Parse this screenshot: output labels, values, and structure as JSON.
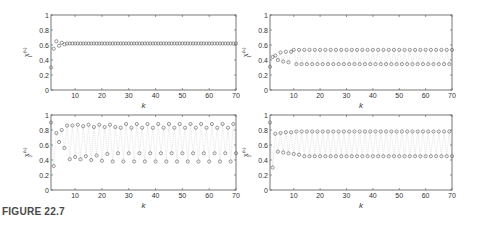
{
  "caption": "FIGURE 22.7",
  "chart_data": [
    {
      "type": "scatter",
      "panel": "top-left",
      "xlabel": "k",
      "ylabel": "x1^(k)",
      "ylabel_base": "x",
      "ylabel_sub": "1",
      "ylabel_sup": "(k)",
      "xlim": [
        1,
        70
      ],
      "ylim": [
        0,
        1
      ],
      "xticks": [
        10,
        20,
        30,
        40,
        50,
        60,
        70
      ],
      "yticks": [
        0,
        0.2,
        0.4,
        0.6,
        0.8,
        1
      ],
      "ytick_labels": [
        "0",
        "0.2",
        "0.4",
        "0.6",
        "0.8",
        "1"
      ],
      "grid": false,
      "marker": "circle",
      "series": [
        {
          "name": "x1",
          "initial": [
            0.3,
            0.55,
            0.65,
            0.59,
            0.63,
            0.61,
            0.62
          ],
          "steady_a": 0.62,
          "steady_b": 0.62
        }
      ]
    },
    {
      "type": "scatter",
      "panel": "top-right",
      "xlabel": "k",
      "ylabel": "x1^(k)",
      "ylabel_base": "x",
      "ylabel_sub": "1",
      "ylabel_sup": "(k)",
      "xlim": [
        1,
        70
      ],
      "ylim": [
        0,
        1
      ],
      "xticks": [
        10,
        20,
        30,
        40,
        50,
        60,
        70
      ],
      "yticks": [
        0,
        0.2,
        0.4,
        0.6,
        0.8,
        1
      ],
      "ytick_labels": [
        "0",
        "0.2",
        "0.4",
        "0.6",
        "0.8",
        "1"
      ],
      "grid": false,
      "marker": "circle",
      "dotted_connectors": true,
      "series": [
        {
          "name": "x1",
          "initial": [
            0.31,
            0.44,
            0.46,
            0.4,
            0.5,
            0.38,
            0.51,
            0.37,
            0.51
          ],
          "steady_a": 0.535,
          "steady_b": 0.345
        }
      ]
    },
    {
      "type": "scatter",
      "panel": "bottom-left",
      "xlabel": "k",
      "ylabel": "x2^(k)",
      "ylabel_base": "x",
      "ylabel_sub": "2",
      "ylabel_sup": "(k)",
      "xlim": [
        1,
        70
      ],
      "ylim": [
        0,
        1
      ],
      "xticks": [
        10,
        20,
        30,
        40,
        50,
        60,
        70
      ],
      "yticks": [
        0,
        0.2,
        0.4,
        0.6,
        0.8,
        1
      ],
      "ytick_labels": [
        "0",
        "0.2",
        "0.4",
        "0.6",
        "0.8",
        "1"
      ],
      "grid": false,
      "marker": "circle",
      "dotted_connectors": true,
      "series": [
        {
          "name": "x2",
          "initial": [
            0.9,
            0.32,
            0.76,
            0.64,
            0.8,
            0.56,
            0.86,
            0.41,
            0.86,
            0.44,
            0.87,
            0.41,
            0.85,
            0.45,
            0.87,
            0.4,
            0.84,
            0.46,
            0.87,
            0.39,
            0.84,
            0.48,
            0.87,
            0.38,
            0.84
          ],
          "steady_hi": [
            0.88,
            0.83
          ],
          "steady_lo": [
            0.49,
            0.38
          ]
        }
      ]
    },
    {
      "type": "scatter",
      "panel": "bottom-right",
      "xlabel": "k",
      "ylabel": "x2^(k)",
      "ylabel_base": "x",
      "ylabel_sub": "2",
      "ylabel_sup": "(k)",
      "xlim": [
        1,
        70
      ],
      "ylim": [
        0,
        1
      ],
      "xticks": [
        10,
        20,
        30,
        40,
        50,
        60,
        70
      ],
      "yticks": [
        0,
        0.2,
        0.4,
        0.6,
        0.8,
        1
      ],
      "ytick_labels": [
        "0",
        "0.2",
        "0.4",
        "0.6",
        "0.8",
        "1"
      ],
      "grid": false,
      "marker": "circle",
      "dotted_connectors": true,
      "series": [
        {
          "name": "x2",
          "initial": [
            0.9,
            0.3,
            0.75,
            0.51,
            0.76,
            0.5,
            0.77,
            0.49,
            0.77,
            0.48,
            0.78,
            0.47
          ],
          "steady_a": 0.78,
          "steady_b": 0.45
        }
      ]
    }
  ],
  "layout": {
    "panels": [
      {
        "x0": 51,
        "y0": 15,
        "x1": 236,
        "y1": 90
      },
      {
        "x0": 270,
        "y0": 15,
        "x1": 452,
        "y1": 90
      },
      {
        "x0": 51,
        "y0": 115,
        "x1": 236,
        "y1": 190
      },
      {
        "x0": 270,
        "y0": 115,
        "x1": 452,
        "y1": 190
      }
    ],
    "step": 2,
    "colors": {
      "axis": "#555555",
      "marker": "#555555",
      "connector": "#bbbbbb",
      "text": "#333333",
      "caption": "#4a4a4a"
    }
  }
}
